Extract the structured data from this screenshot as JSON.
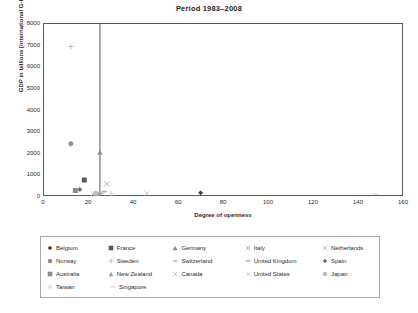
{
  "chart_data": {
    "type": "scatter",
    "title": "Period 1983–2008",
    "xlabel": "Degree of openness",
    "ylabel": "GDP in billions [international G-K dollars]",
    "xlim": [
      0,
      160
    ],
    "ylim": [
      0,
      8000
    ],
    "xticks": [
      0,
      20,
      40,
      60,
      80,
      100,
      120,
      140,
      160
    ],
    "yticks": [
      0,
      1000,
      2000,
      3000,
      4000,
      5000,
      6000,
      7000,
      8000
    ],
    "grid": false,
    "legend_position": "bottom",
    "annotations": [
      {
        "name": "vertical-reference-line",
        "type": "vline",
        "x": 25
      }
    ],
    "series": [
      {
        "name": "Belgium",
        "marker": "diamond",
        "color": "#404040",
        "x": 70,
        "y": 100
      },
      {
        "name": "France",
        "marker": "square",
        "color": "#595959",
        "x": 18,
        "y": 700
      },
      {
        "name": "Germany",
        "marker": "triangle",
        "color": "#8c8c8c",
        "x": 25,
        "y": 2000
      },
      {
        "name": "Italy",
        "marker": "cross-x",
        "color": "#b0b0b0",
        "x": 28,
        "y": 520
      },
      {
        "name": "Netherlands",
        "marker": "cross-x",
        "color": "#c4c4c4",
        "x": 26,
        "y": 110
      },
      {
        "name": "Norway",
        "marker": "circle",
        "color": "#8f8f8f",
        "x": 12,
        "y": 2400
      },
      {
        "name": "Sweden",
        "marker": "plus",
        "color": "#b8b8b8",
        "x": 12,
        "y": 6950
      },
      {
        "name": "Switzerland",
        "marker": "dash",
        "color": "#a0a0a0",
        "x": 27,
        "y": 150
      },
      {
        "name": "United Kingdom",
        "marker": "dash",
        "color": "#9a9a9a",
        "x": 25,
        "y": 60
      },
      {
        "name": "Spain",
        "marker": "diamond",
        "color": "#6e6e6e",
        "x": 16,
        "y": 260
      },
      {
        "name": "Australia",
        "marker": "square",
        "color": "#8a8a8a",
        "x": 14,
        "y": 210
      },
      {
        "name": "New Zealand",
        "marker": "triangle",
        "color": "#9c9c9c",
        "x": 24,
        "y": 70
      },
      {
        "name": "Canada",
        "marker": "cross-x",
        "color": "#cccccc",
        "x": 46,
        "y": 90
      },
      {
        "name": "United States",
        "marker": "cross-x",
        "color": "#d2d2d2",
        "x": 22,
        "y": 60
      },
      {
        "name": "Japan",
        "marker": "circle",
        "color": "#bdbdbd",
        "x": 23,
        "y": 80
      },
      {
        "name": "Taiwan",
        "marker": "plus",
        "color": "#cfcfcf",
        "x": 30,
        "y": 70
      },
      {
        "name": "Singapore",
        "marker": "dash",
        "color": "#d8d8d8",
        "x": 148,
        "y": 40
      }
    ]
  },
  "legend": {
    "rows": [
      [
        "Belgium",
        "France",
        "Germany",
        "Italy",
        "Netherlands"
      ],
      [
        "Norway",
        "Sweden",
        "Switzerland",
        "United Kingdom",
        "Spain"
      ],
      [
        "Australia",
        "New Zealand",
        "Canada",
        "United States",
        "Japan"
      ],
      [
        "Taiwan",
        "Singapore"
      ]
    ]
  }
}
